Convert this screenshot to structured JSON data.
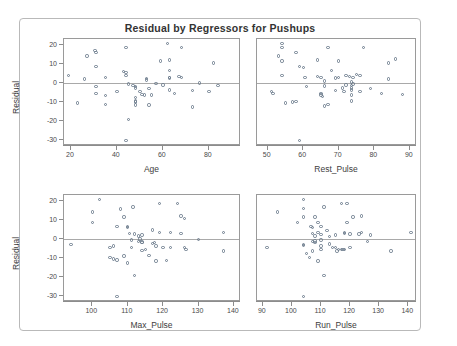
{
  "title": "Residual by Regressors for Pushups",
  "chart_data": {
    "type": "scatter",
    "title": "Residual by Regressors for Pushups",
    "layout": "2x2 panel grid of residual-vs-regressor scatter plots",
    "grid": false,
    "legend": "none",
    "reference_line": {
      "axis": "y",
      "value": 0,
      "color": "#a9a9a9"
    },
    "marker": {
      "shape": "open-circle",
      "size": 3,
      "color": "#6b7b8c"
    },
    "shared_ylabel": "Residual",
    "panels": [
      {
        "index": 0,
        "position": "top-left",
        "xlabel": "Age",
        "ylabel": "Residual",
        "xlim": [
          17,
          94
        ],
        "ylim": [
          -33,
          23
        ],
        "xticks": [
          20,
          40,
          60,
          80
        ],
        "yticks": [
          -30,
          -20,
          -10,
          0,
          10,
          20
        ],
        "points": [
          [
            19,
            4
          ],
          [
            23,
            -10.4
          ],
          [
            26,
            2
          ],
          [
            27,
            14
          ],
          [
            30.5,
            17
          ],
          [
            31,
            16
          ],
          [
            31,
            8.6
          ],
          [
            31,
            -2
          ],
          [
            31,
            -5.6
          ],
          [
            35,
            3
          ],
          [
            35,
            -6.6
          ],
          [
            35,
            -11.4
          ],
          [
            40,
            -4.5
          ],
          [
            44,
            18.4
          ],
          [
            43,
            6
          ],
          [
            44,
            5.5
          ],
          [
            44,
            4
          ],
          [
            44,
            -30
          ],
          [
            45,
            -0.6
          ],
          [
            45,
            -19
          ],
          [
            47,
            -1.4
          ],
          [
            48,
            -2
          ],
          [
            48,
            -2.6
          ],
          [
            48,
            -9.5
          ],
          [
            48,
            -10
          ],
          [
            48,
            -7.6
          ],
          [
            48,
            -11.6
          ],
          [
            50,
            -4.6
          ],
          [
            51,
            -6
          ],
          [
            52,
            -6.4
          ],
          [
            53,
            2.4
          ],
          [
            53,
            1.5
          ],
          [
            54,
            -3
          ],
          [
            54,
            -11.6
          ],
          [
            55,
            -6.4
          ],
          [
            57,
            -0.3
          ],
          [
            59,
            11.4
          ],
          [
            60,
            -1
          ],
          [
            62,
            20.6
          ],
          [
            63,
            12
          ],
          [
            63,
            6.6
          ],
          [
            63,
            3
          ],
          [
            63,
            2.6
          ],
          [
            63,
            -3.6
          ],
          [
            65,
            -5.6
          ],
          [
            67,
            3.4
          ],
          [
            68,
            3
          ],
          [
            68,
            18.6
          ],
          [
            73,
            -4
          ],
          [
            73,
            -12.6
          ],
          [
            76,
            0
          ],
          [
            80,
            -4.6
          ],
          [
            82,
            10.4
          ],
          [
            84,
            -1.4
          ]
        ]
      },
      {
        "index": 1,
        "position": "top-right",
        "xlabel": "Rest_Pulse",
        "ylabel": "Residual",
        "xlim": [
          47,
          92
        ],
        "ylim": [
          -33,
          23
        ],
        "xticks": [
          50,
          60,
          70,
          80,
          90
        ],
        "yticks": [],
        "points": [
          [
            51,
            -4.5
          ],
          [
            51.5,
            -5.6
          ],
          [
            53,
            14
          ],
          [
            54,
            20.6
          ],
          [
            54,
            18.4
          ],
          [
            54,
            11.4
          ],
          [
            54,
            4
          ],
          [
            55,
            -10.4
          ],
          [
            57,
            -10
          ],
          [
            58,
            -9.6
          ],
          [
            58,
            16
          ],
          [
            59,
            -30
          ],
          [
            59,
            8.6
          ],
          [
            60,
            8
          ],
          [
            60.5,
            3
          ],
          [
            61,
            -2
          ],
          [
            64,
            12
          ],
          [
            64,
            3.4
          ],
          [
            65,
            3
          ],
          [
            65,
            -5.6
          ],
          [
            65,
            -6.4
          ],
          [
            65.5,
            -7
          ],
          [
            66,
            1
          ],
          [
            66,
            -1.5
          ],
          [
            66,
            -12
          ],
          [
            67,
            -11.4
          ],
          [
            67,
            18.6
          ],
          [
            68,
            6.6
          ],
          [
            69,
            2.5
          ],
          [
            69,
            -4
          ],
          [
            70,
            11.4
          ],
          [
            70,
            3
          ],
          [
            71,
            -2.6
          ],
          [
            71.5,
            -4.6
          ],
          [
            72,
            4
          ],
          [
            72,
            -1
          ],
          [
            73,
            3.4
          ],
          [
            73.5,
            0.5
          ],
          [
            73.5,
            -1.4
          ],
          [
            73.5,
            -2.6
          ],
          [
            73.5,
            -3.6
          ],
          [
            73.5,
            -6.4
          ],
          [
            73.5,
            -9.5
          ],
          [
            74,
            3
          ],
          [
            74,
            -0.6
          ],
          [
            75,
            4.4
          ],
          [
            76,
            4
          ],
          [
            76,
            -4.5
          ],
          [
            77,
            18.4
          ],
          [
            79,
            -3
          ],
          [
            82,
            -5.6
          ],
          [
            84,
            2
          ],
          [
            84,
            10.4
          ],
          [
            86,
            12.6
          ],
          [
            88,
            -6
          ]
        ]
      },
      {
        "index": 2,
        "position": "bottom-left",
        "xlabel": "Max_Pulse",
        "ylabel": "Residual",
        "xlim": [
          92,
          142
        ],
        "ylim": [
          -33,
          23
        ],
        "xticks": [
          100,
          110,
          120,
          130,
          140
        ],
        "yticks": [
          -30,
          -20,
          -10,
          0,
          10,
          20
        ],
        "points": [
          [
            94,
            -3
          ],
          [
            100,
            14
          ],
          [
            100,
            8.6
          ],
          [
            102,
            20.6
          ],
          [
            105,
            -4.5
          ],
          [
            105,
            -9.6
          ],
          [
            106,
            -10.4
          ],
          [
            106,
            -3.6
          ],
          [
            107,
            -11
          ],
          [
            107,
            6.6
          ],
          [
            107,
            -30
          ],
          [
            108,
            15.6
          ],
          [
            109,
            11.4
          ],
          [
            109,
            -9
          ],
          [
            110,
            6.6
          ],
          [
            110,
            6
          ],
          [
            110.5,
            3
          ],
          [
            110,
            -12.6
          ],
          [
            111,
            -0.6
          ],
          [
            111,
            -4.6
          ],
          [
            111.5,
            16.8
          ],
          [
            112,
            2.6
          ],
          [
            112,
            -19
          ],
          [
            113,
            1.5
          ],
          [
            113,
            -1.4
          ],
          [
            113.5,
            0
          ],
          [
            114,
            2
          ],
          [
            114,
            -1.6
          ],
          [
            114,
            -2
          ],
          [
            114,
            -6
          ],
          [
            115,
            -5.6
          ],
          [
            116,
            -8.6
          ],
          [
            117,
            4.6
          ],
          [
            117,
            -2.4
          ],
          [
            117.5,
            -2
          ],
          [
            118,
            -11.6
          ],
          [
            118,
            -3.6
          ],
          [
            119,
            18.4
          ],
          [
            119,
            3.4
          ],
          [
            120,
            -4.6
          ],
          [
            121,
            -11.4
          ],
          [
            122,
            -4.6
          ],
          [
            122,
            3.4
          ],
          [
            124,
            18.6
          ],
          [
            125,
            12
          ],
          [
            125,
            3
          ],
          [
            126,
            10.6
          ],
          [
            126,
            -4.6
          ],
          [
            126.5,
            -5.6
          ],
          [
            130,
            -0.3
          ],
          [
            137,
            3.4
          ],
          [
            137,
            -6.4
          ]
        ]
      },
      {
        "index": 3,
        "position": "bottom-right",
        "xlabel": "Run_Pulse",
        "ylabel": "Residual",
        "xlim": [
          88,
          143
        ],
        "ylim": [
          -33,
          23
        ],
        "xticks": [
          90,
          100,
          110,
          120,
          130,
          140
        ],
        "yticks": [],
        "points": [
          [
            91.5,
            -4.5
          ],
          [
            95,
            14
          ],
          [
            102,
            8.6
          ],
          [
            104,
            20.6
          ],
          [
            104,
            16
          ],
          [
            104,
            -3
          ],
          [
            104,
            -3.4
          ],
          [
            104,
            -30
          ],
          [
            104,
            11.4
          ],
          [
            105,
            -7.6
          ],
          [
            106,
            -9.6
          ],
          [
            106.5,
            6.6
          ],
          [
            107,
            6
          ],
          [
            107,
            3
          ],
          [
            107,
            -1.4
          ],
          [
            107,
            -6.4
          ],
          [
            108,
            11.4
          ],
          [
            108,
            1.6
          ],
          [
            108,
            -1
          ],
          [
            108,
            -2
          ],
          [
            109,
            8.6
          ],
          [
            109,
            3.4
          ],
          [
            109,
            -11.6
          ],
          [
            110,
            6.6
          ],
          [
            110,
            2.4
          ],
          [
            110,
            -0.6
          ],
          [
            110,
            -3.6
          ],
          [
            110,
            -5.6
          ],
          [
            111,
            16.8
          ],
          [
            111,
            -19
          ],
          [
            112,
            4.4
          ],
          [
            113,
            1.4
          ],
          [
            113,
            -2.6
          ],
          [
            114,
            -4.6
          ],
          [
            115,
            2
          ],
          [
            115,
            -4.6
          ],
          [
            115.5,
            -6.4
          ],
          [
            116,
            -5.6
          ],
          [
            117,
            18.4
          ],
          [
            117,
            -5.6
          ],
          [
            117.5,
            -5.6
          ],
          [
            118,
            -5.6
          ],
          [
            118,
            3
          ],
          [
            118,
            3.4
          ],
          [
            119,
            18.6
          ],
          [
            119,
            8.6
          ],
          [
            120,
            -4.6
          ],
          [
            120,
            2.6
          ],
          [
            121,
            11.4
          ],
          [
            123,
            2.6
          ],
          [
            124,
            12
          ],
          [
            124,
            3.4
          ],
          [
            126,
            -1.4
          ],
          [
            127,
            2
          ],
          [
            134,
            -6.4
          ],
          [
            141,
            3.4
          ]
        ]
      }
    ]
  }
}
